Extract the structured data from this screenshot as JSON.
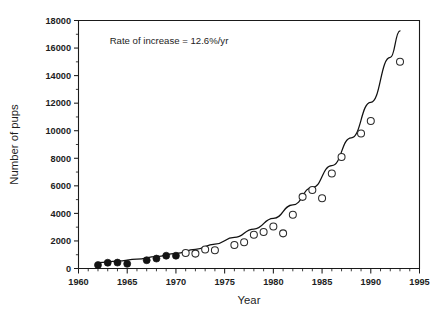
{
  "chart_data": {
    "type": "scatter",
    "title": "",
    "xlabel": "Year",
    "ylabel": "Number of pups",
    "xlim": [
      1960,
      1995
    ],
    "ylim": [
      0,
      18000
    ],
    "xticks": [
      1960,
      1965,
      1970,
      1975,
      1980,
      1985,
      1990,
      1995
    ],
    "xtick_labels": [
      "1960",
      "1965",
      "1970",
      "1975",
      "1980",
      "1985",
      "1990",
      "1995"
    ],
    "x_minor_interval": 1,
    "yticks": [
      0,
      2000,
      4000,
      6000,
      8000,
      10000,
      12000,
      14000,
      16000,
      18000
    ],
    "ytick_labels": [
      "0",
      "2000",
      "4000",
      "6000",
      "8000",
      "10000",
      "12000",
      "14000",
      "16000",
      "18000"
    ],
    "y_minor_interval": 1000,
    "grid": false,
    "legend": "none",
    "annotations": [
      {
        "text": "Rate of increase = 12.6%/yr",
        "x": 1963.2,
        "y": 16300
      }
    ],
    "series": [
      {
        "name": "Early counts (filled circles)",
        "marker": "filled-circle",
        "points": [
          {
            "x": 1962,
            "y": 250
          },
          {
            "x": 1963,
            "y": 420
          },
          {
            "x": 1964,
            "y": 430
          },
          {
            "x": 1965,
            "y": 340
          },
          {
            "x": 1967,
            "y": 600
          },
          {
            "x": 1968,
            "y": 720
          },
          {
            "x": 1969,
            "y": 930
          },
          {
            "x": 1970,
            "y": 930
          }
        ]
      },
      {
        "name": "Later counts (open circles)",
        "marker": "open-circle",
        "points": [
          {
            "x": 1971,
            "y": 1120
          },
          {
            "x": 1972,
            "y": 1080
          },
          {
            "x": 1973,
            "y": 1380
          },
          {
            "x": 1974,
            "y": 1320
          },
          {
            "x": 1976,
            "y": 1700
          },
          {
            "x": 1977,
            "y": 1900
          },
          {
            "x": 1978,
            "y": 2450
          },
          {
            "x": 1979,
            "y": 2650
          },
          {
            "x": 1980,
            "y": 3050
          },
          {
            "x": 1981,
            "y": 2550
          },
          {
            "x": 1982,
            "y": 3900
          },
          {
            "x": 1983,
            "y": 5200
          },
          {
            "x": 1984,
            "y": 5700
          },
          {
            "x": 1985,
            "y": 5100
          },
          {
            "x": 1986,
            "y": 6900
          },
          {
            "x": 1987,
            "y": 8100
          },
          {
            "x": 1989,
            "y": 9800
          },
          {
            "x": 1990,
            "y": 10700
          },
          {
            "x": 1993,
            "y": 15000
          }
        ]
      },
      {
        "name": "Exponential fit (12.6%/yr)",
        "marker": "line",
        "fit_type": "exponential",
        "fit_rate_percent_per_year": 12.6,
        "fit_points": [
          {
            "x": 1962,
            "y": 420
          },
          {
            "x": 1964,
            "y": 535
          },
          {
            "x": 1966,
            "y": 680
          },
          {
            "x": 1968,
            "y": 865
          },
          {
            "x": 1970,
            "y": 1100
          },
          {
            "x": 1972,
            "y": 1395
          },
          {
            "x": 1974,
            "y": 1775
          },
          {
            "x": 1976,
            "y": 2255
          },
          {
            "x": 1978,
            "y": 2865
          },
          {
            "x": 1980,
            "y": 3640
          },
          {
            "x": 1982,
            "y": 4625
          },
          {
            "x": 1984,
            "y": 5880
          },
          {
            "x": 1986,
            "y": 7470
          },
          {
            "x": 1988,
            "y": 9490
          },
          {
            "x": 1990,
            "y": 12060
          },
          {
            "x": 1992,
            "y": 15320
          },
          {
            "x": 1993,
            "y": 17250
          }
        ]
      }
    ],
    "colors": {
      "axis": "#1a1a1a",
      "curve": "#111111",
      "filled_marker": "#141414",
      "open_marker_stroke": "#2b2b2b",
      "open_marker_fill": "#ffffff",
      "text": "#1d1d1d",
      "background": "#ffffff"
    }
  }
}
